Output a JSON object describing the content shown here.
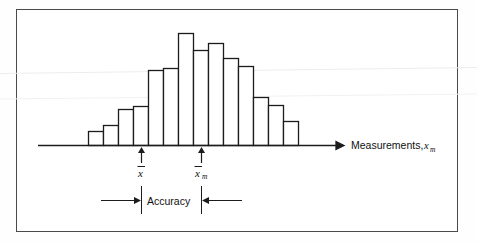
{
  "figure": {
    "kind": "histogram-accuracy-diagram",
    "background_color": "#ffffff",
    "frame_color": "#4a4a4a",
    "ink_color": "#1c1c1c"
  },
  "axis": {
    "title_text": "Measurements,",
    "title_variable": "x",
    "title_subscript": "m",
    "arrow": "right-arrow-icon"
  },
  "markers": [
    {
      "id": "true-value",
      "label_variable": "x",
      "label_subscript": "",
      "has_overbar": true,
      "arrow": "up-arrow-icon"
    },
    {
      "id": "mean-measured-value",
      "label_variable": "x",
      "label_subscript": "m",
      "has_overbar": true,
      "arrow": "up-arrow-icon"
    }
  ],
  "dimension": {
    "label": "Accuracy",
    "left_arrow": "right-arrow-icon",
    "right_arrow": "left-arrow-icon"
  },
  "chart_data": {
    "type": "bar",
    "title": "",
    "xlabel": "Measurements, x_m",
    "ylabel": "",
    "grid": false,
    "legend": null,
    "categories": [
      "1",
      "2",
      "3",
      "4",
      "5",
      "6",
      "7",
      "8",
      "9",
      "10",
      "11",
      "12",
      "13",
      "14"
    ],
    "values": [
      14,
      20,
      36,
      39,
      75,
      77,
      112,
      95,
      102,
      87,
      79,
      48,
      40,
      24
    ],
    "bar_left_edges_px": [
      88,
      103,
      118,
      133,
      148,
      163,
      178,
      193,
      208,
      223,
      238,
      253,
      268,
      283
    ],
    "bar_width_px": 15,
    "baseline_y_px": 145,
    "ylim": [
      0,
      120
    ],
    "annotations": [
      {
        "text": "x̄",
        "x_px": 140,
        "kind": "true-value-marker"
      },
      {
        "text": "x̄m",
        "x_px": 200,
        "kind": "mean-marker"
      },
      {
        "text": "Accuracy",
        "x_px": 170,
        "kind": "span-label"
      }
    ]
  }
}
